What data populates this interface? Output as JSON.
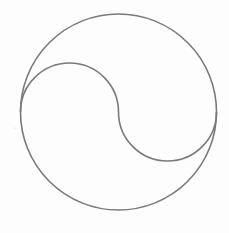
{
  "diagram": {
    "type": "yin-yang-outline",
    "stroke_color": "#7a7a7a",
    "background_color": "#fdfdfd",
    "outer_circle": {
      "cx": 118.5,
      "cy": 112,
      "r": 98
    },
    "s_curve": {
      "start": [
        20.5,
        112
      ],
      "mid": [
        118.5,
        112
      ],
      "end": [
        216.5,
        112
      ],
      "upper_arc_radius": 49,
      "lower_arc_radius": 49
    }
  }
}
